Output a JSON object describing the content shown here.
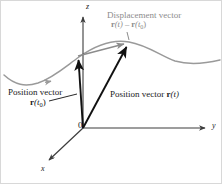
{
  "figure": {
    "title_semantic": "position-and-displacement-vectors-diagram",
    "colors": {
      "curve": "#9a9a9a",
      "vector_black": "#111111",
      "displacement_gray": "#8c8c8c",
      "axis": "#3c3c3c",
      "background": "#ffffff",
      "border": "#d8d8d8"
    }
  },
  "axes": {
    "z_label": "z",
    "y_label": "y",
    "x_label": "x",
    "origin_label": "0"
  },
  "labels": {
    "displacement": {
      "line1": "Displacement vector",
      "line2_prefix": "r",
      "line2_arg1": "(t)",
      "line2_minus": " – ",
      "line2_prefix2": "r",
      "line2_arg2": "(t",
      "line2_sub": "0",
      "line2_close": ")"
    },
    "position_t0": {
      "line1": "Position vector",
      "line2_vec": "r",
      "line2_arg": "(t",
      "line2_sub": "0",
      "line2_close": ")"
    },
    "position_t": {
      "text_prefix": "Position vector ",
      "vec": "r",
      "arg": "(t)"
    }
  },
  "geometry": {
    "origin": [
      82,
      127
    ],
    "z_axis_tip": [
      82,
      14
    ],
    "y_axis_tip": [
      207,
      127
    ],
    "x_axis_tip": [
      46,
      161
    ],
    "r_t0_tip": [
      77,
      55
    ],
    "r_t_tip": [
      127,
      42
    ],
    "curve_peak": [
      130,
      42
    ],
    "curve_trough": [
      36,
      82
    ]
  }
}
